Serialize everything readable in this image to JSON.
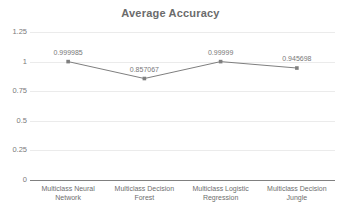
{
  "chart_data": {
    "type": "line",
    "title": "Average Accuracy",
    "xlabel": "",
    "ylabel": "",
    "ylim": [
      0,
      1.25
    ],
    "yticks": [
      "0",
      "0.25",
      "0.5",
      "0.75",
      "1",
      "1.25"
    ],
    "ytick_values": [
      0,
      0.25,
      0.5,
      0.75,
      1,
      1.25
    ],
    "grid": true,
    "legend": "none",
    "categories": [
      "Multiclass Neural Network",
      "Multiclass Decision Forest",
      "Multiclass Logistic Regression",
      "Multiclass Decision Jungle"
    ],
    "category_lines": [
      [
        "Multiclass Neural",
        "Network"
      ],
      [
        "Multiclass Decision",
        "Forest"
      ],
      [
        "Multiclass Logistic",
        "Regression"
      ],
      [
        "Multiclass Decision",
        "Jungle"
      ]
    ],
    "values": [
      0.999985,
      0.857067,
      0.99999,
      0.945698
    ],
    "point_labels": [
      "0.999985",
      "0.857067",
      "0.99999",
      "0.945698"
    ],
    "series_color": "#7f7f7f",
    "grid_color": "#ebebeb",
    "axis_color": "#808080",
    "title_color": "#6b6b6b",
    "label_color": "#787878"
  }
}
